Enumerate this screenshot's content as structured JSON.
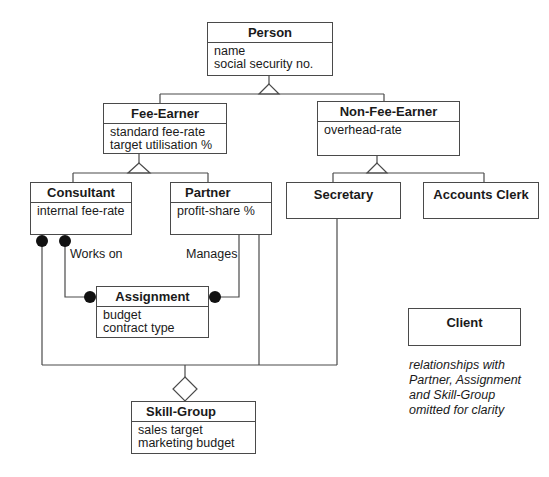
{
  "diagram": {
    "type": "UML class diagram",
    "classes": {
      "person": {
        "name": "Person",
        "attributes": [
          "name",
          "social security no."
        ]
      },
      "fee_earner": {
        "name": "Fee-Earner",
        "attributes": [
          "standard fee-rate",
          "target utilisation %"
        ]
      },
      "non_fee_earner": {
        "name": "Non-Fee-Earner",
        "attributes": [
          "overhead-rate"
        ]
      },
      "consultant": {
        "name": "Consultant",
        "attributes": [
          "internal fee-rate"
        ]
      },
      "partner": {
        "name": "Partner",
        "attributes": [
          "profit-share %"
        ]
      },
      "secretary": {
        "name": "Secretary",
        "attributes": []
      },
      "accounts_clerk": {
        "name": "Accounts Clerk",
        "attributes": []
      },
      "assignment": {
        "name": "Assignment",
        "attributes": [
          "budget",
          "contract type"
        ]
      },
      "skill_group": {
        "name": "Skill-Group",
        "attributes": [
          "sales target",
          "marketing budget"
        ]
      },
      "client": {
        "name": "Client",
        "attributes": []
      }
    },
    "associations": {
      "works_on": "Works on",
      "manages": "Manages"
    },
    "note": {
      "lines": [
        "relationships with",
        "Partner, Assignment",
        "and Skill-Group",
        "omitted for clarity"
      ]
    },
    "colors": {
      "line": "#4a4a4a",
      "text": "#1a1a1a",
      "background": "#ffffff"
    }
  }
}
